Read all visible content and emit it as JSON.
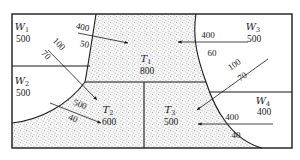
{
  "colors": {
    "line": "#1a1a1a",
    "stipple_bg": "#f6f6f6",
    "stipple_dot": "#555555",
    "white_region": "#ffffff"
  },
  "regions": {
    "W1": {
      "name": "W",
      "sub": "1",
      "value": "500",
      "type": "water",
      "label_x": 22,
      "label_y": 30,
      "value_y": 42
    },
    "W2": {
      "name": "W",
      "sub": "2",
      "value": "500",
      "type": "water",
      "label_x": 22,
      "label_y": 84,
      "value_y": 96
    },
    "W3": {
      "name": "W",
      "sub": "3",
      "value": "500",
      "type": "water",
      "label_x": 253,
      "label_y": 30,
      "value_y": 42
    },
    "W4": {
      "name": "W",
      "sub": "4",
      "value": "400",
      "type": "water",
      "label_x": 263,
      "label_y": 104,
      "value_y": 115
    },
    "T1": {
      "name": "T",
      "sub": "1",
      "value": "800",
      "type": "terrain",
      "label_x": 146,
      "label_y": 62,
      "value_y": 74
    },
    "T2": {
      "name": "T",
      "sub": "2",
      "value": "600",
      "type": "terrain",
      "label_x": 108,
      "label_y": 113,
      "value_y": 125
    },
    "T3": {
      "name": "T",
      "sub": "3",
      "value": "500",
      "type": "terrain",
      "label_x": 170,
      "label_y": 113,
      "value_y": 125
    }
  },
  "flows": [
    {
      "id": "W1-T1",
      "top": "400",
      "bottom": "50",
      "x1": 78,
      "y1": 33,
      "x2": 128,
      "y2": 43,
      "top_x": 82,
      "top_y": 30,
      "bot_x": 84,
      "bot_y": 47,
      "rotate": 12
    },
    {
      "id": "W3-T1",
      "top": "400",
      "bottom": "60",
      "x1": 248,
      "y1": 42,
      "x2": 178,
      "y2": 42,
      "top_x": 208,
      "top_y": 38,
      "bot_x": 212,
      "bot_y": 56,
      "rotate": 0
    },
    {
      "id": "W1-T2",
      "top": "100",
      "bottom": "70",
      "x1": 48,
      "y1": 50,
      "x2": 97,
      "y2": 100,
      "top_x": 57,
      "top_y": 46,
      "bot_x": 44,
      "bot_y": 57,
      "rotate": 45
    },
    {
      "id": "W2-T2",
      "top": "500",
      "bottom": "40",
      "x1": 50,
      "y1": 103,
      "x2": 101,
      "y2": 123,
      "top_x": 79,
      "top_y": 107,
      "bot_x": 72,
      "bot_y": 121,
      "rotate": 22
    },
    {
      "id": "W3-T3",
      "top": "100",
      "bottom": "70",
      "x1": 268,
      "y1": 59,
      "x2": 197,
      "y2": 110,
      "top_x": 236,
      "top_y": 67,
      "bot_x": 244,
      "bot_y": 79,
      "rotate": -35
    },
    {
      "id": "W4-T3",
      "top": "400",
      "bottom": "40",
      "x1": 273,
      "y1": 124,
      "x2": 198,
      "y2": 124,
      "top_x": 232,
      "top_y": 120,
      "bot_x": 236,
      "bot_y": 138,
      "rotate": 0
    }
  ]
}
